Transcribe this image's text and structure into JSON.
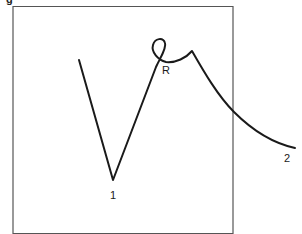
{
  "figure": {
    "caption_fragment": "g",
    "frame": {
      "left": 13,
      "top": 6,
      "right": 233,
      "bottom": 234,
      "stroke": "#555555"
    },
    "path": {
      "stroke": "#1a1a1a",
      "segments": [
        "start at upper-left end (79,60)",
        "straight line down to vertex 1 (113,180)",
        "straight line up to loop R (157,66)",
        "small loop near (160,50)",
        "curve right to peak (192,51)",
        "line/curve down crossing frame right edge (~233,111)",
        "curve to end 2 (295,148)"
      ]
    },
    "labels": {
      "point1": "1",
      "pointR": "R",
      "point2": "2"
    }
  }
}
